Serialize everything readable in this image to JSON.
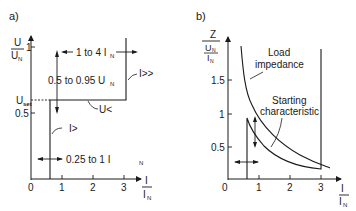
{
  "panel_a": {
    "label": "a)",
    "y_axis": {
      "num": "U",
      "den": "U",
      "den_sub": "N",
      "ticks": [
        "1",
        "0.5"
      ]
    },
    "x_axis": {
      "num": "I",
      "den": "I",
      "den_sub": "N",
      "ticks": [
        "0",
        "1",
        "2",
        "3"
      ]
    },
    "u_set": {
      "main": "U",
      "sub": "set"
    },
    "annotations": {
      "range_top": {
        "main": "1 to 4 I",
        "sub": "N"
      },
      "range_voltage": {
        "main": "0.5 to 0.95 U",
        "sub": "N"
      },
      "range_bottom": {
        "main": "0.25 to 1 I",
        "sub": "N"
      },
      "i_high": "I>>",
      "u_low": "U<",
      "i_low": "I>"
    }
  },
  "panel_b": {
    "label": "b)",
    "y_axis": {
      "num": "Z",
      "mid_num": "U",
      "mid_sub": "N",
      "den": "I",
      "den_sub": "N",
      "ticks": [
        "1.5",
        "1",
        "0.5"
      ]
    },
    "x_axis": {
      "num": "I",
      "den": "I",
      "den_sub": "N",
      "ticks": [
        "0",
        "1",
        "2",
        "3"
      ]
    },
    "annotations": {
      "load_line1": "Load",
      "load_line2": "impedance",
      "start_line1": "Starting",
      "start_line2": "characteristic"
    }
  },
  "colors": {
    "ink": "#1a1a1a",
    "background": "#ffffff"
  }
}
